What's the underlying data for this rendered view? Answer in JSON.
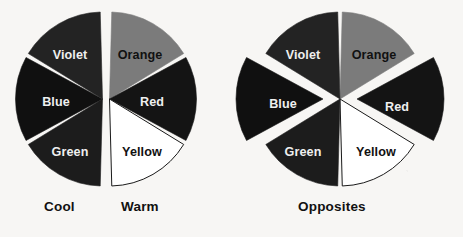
{
  "figure": {
    "background_color": "#f7f6f4",
    "captions": [
      {
        "id": "cool",
        "text": "Cool",
        "x": 44,
        "y": 199
      },
      {
        "id": "warm",
        "text": "Warm",
        "x": 121,
        "y": 199
      },
      {
        "id": "opposites",
        "text": "Opposites",
        "x": 298,
        "y": 199
      }
    ]
  },
  "chart_data": {
    "type": "pie",
    "title": "",
    "charts": [
      {
        "name": "cool-warm-wheel",
        "caption": "Cool / Warm",
        "center": [
          106,
          99
        ],
        "radius": 87,
        "split": "vertical",
        "gap_degrees": 3,
        "categories": [
          "Orange",
          "Red",
          "Yellow",
          "Green",
          "Blue",
          "Violet"
        ],
        "values": [
          60,
          60,
          60,
          60,
          60,
          60
        ],
        "slices": [
          {
            "label": "Orange",
            "start_angle": 0,
            "end_angle": 60,
            "fill": "#7b7b7b",
            "stroke": "#1a1a1a",
            "label_fill": "#111111",
            "exploded": false,
            "lx": 140,
            "ly": 56
          },
          {
            "label": "Red",
            "start_angle": 60,
            "end_angle": 120,
            "fill": "#141414",
            "stroke": "#1a1a1a",
            "label_fill": "#efefef",
            "exploded": false,
            "lx": 152,
            "ly": 103
          },
          {
            "label": "Yellow",
            "start_angle": 120,
            "end_angle": 180,
            "fill": "#ffffff",
            "stroke": "#1a1a1a",
            "label_fill": "#111111",
            "exploded": false,
            "lx": 142,
            "ly": 153
          },
          {
            "label": "Green",
            "start_angle": 180,
            "end_angle": 240,
            "fill": "#1c1c1c",
            "stroke": "#1a1a1a",
            "label_fill": "#efefef",
            "exploded": false,
            "lx": 70,
            "ly": 153
          },
          {
            "label": "Blue",
            "start_angle": 240,
            "end_angle": 300,
            "fill": "#101010",
            "stroke": "#1a1a1a",
            "label_fill": "#efefef",
            "exploded": false,
            "lx": 56,
            "ly": 103
          },
          {
            "label": "Violet",
            "start_angle": 300,
            "end_angle": 360,
            "fill": "#232323",
            "stroke": "#1a1a1a",
            "label_fill": "#efefef",
            "exploded": false,
            "lx": 70,
            "ly": 56
          }
        ]
      },
      {
        "name": "opposites-wheel",
        "caption": "Opposites",
        "center": [
          340,
          99
        ],
        "radius": 87,
        "split": "exploded",
        "gap_degrees": 3,
        "categories": [
          "Orange",
          "Red",
          "Yellow",
          "Green",
          "Blue",
          "Violet"
        ],
        "values": [
          60,
          60,
          60,
          60,
          60,
          60
        ],
        "slices": [
          {
            "label": "Orange",
            "start_angle": 0,
            "end_angle": 60,
            "fill": "#7b7b7b",
            "stroke": "#1a1a1a",
            "label_fill": "#111111",
            "exploded": false,
            "offset": 0,
            "lx": 374,
            "ly": 56
          },
          {
            "label": "Red",
            "start_angle": 60,
            "end_angle": 120,
            "fill": "#141414",
            "stroke": "#1a1a1a",
            "label_fill": "#efefef",
            "exploded": true,
            "offset": 17,
            "lx": 397,
            "ly": 108
          },
          {
            "label": "Yellow",
            "start_angle": 120,
            "end_angle": 180,
            "fill": "#ffffff",
            "stroke": "#1a1a1a",
            "label_fill": "#111111",
            "exploded": false,
            "offset": 0,
            "lx": 376,
            "ly": 153
          },
          {
            "label": "Green",
            "start_angle": 180,
            "end_angle": 240,
            "fill": "#1c1c1c",
            "stroke": "#1a1a1a",
            "label_fill": "#efefef",
            "exploded": false,
            "offset": 0,
            "lx": 303,
            "ly": 153
          },
          {
            "label": "Blue",
            "start_angle": 240,
            "end_angle": 300,
            "fill": "#101010",
            "stroke": "#1a1a1a",
            "label_fill": "#efefef",
            "exploded": true,
            "offset": 17,
            "lx": 283,
            "ly": 105
          },
          {
            "label": "Violet",
            "start_angle": 300,
            "end_angle": 360,
            "fill": "#232323",
            "stroke": "#1a1a1a",
            "label_fill": "#efefef",
            "exploded": false,
            "offset": 0,
            "lx": 303,
            "ly": 56
          }
        ]
      }
    ],
    "legend": [
      "Cool",
      "Warm",
      "Opposites"
    ]
  }
}
